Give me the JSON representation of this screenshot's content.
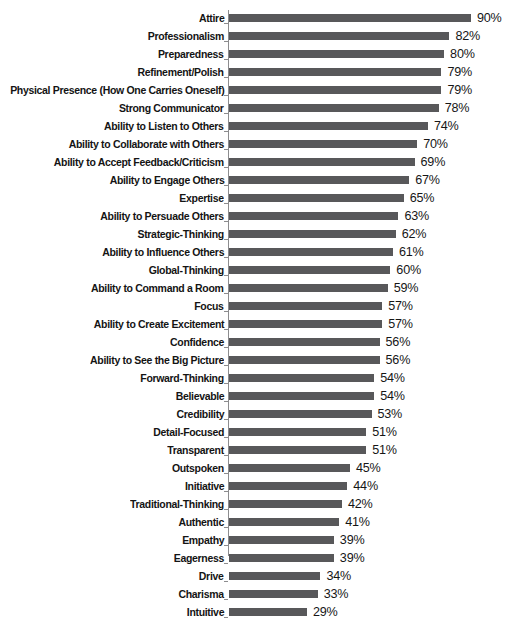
{
  "chart_data": {
    "type": "bar",
    "orientation": "horizontal",
    "title": "",
    "subtitle": "",
    "xlabel": "",
    "ylabel": "",
    "xlim": [
      0,
      90
    ],
    "grid": false,
    "legend": null,
    "value_suffix": "%",
    "bar_color": "#58585a",
    "axis_color": "#8c8c8e",
    "label_color": "#141414",
    "background": "#ffffff",
    "categories": [
      "Attire",
      "Professionalism",
      "Preparedness",
      "Refinement/Polish",
      "Physical Presence (How One Carries Oneself)",
      "Strong Communicator",
      "Ability to Listen to Others",
      "Ability to Collaborate with Others",
      "Ability to Accept Feedback/Criticism",
      "Ability to Engage Others",
      "Expertise",
      "Ability to Persuade Others",
      "Strategic-Thinking",
      "Ability to Influence Others",
      "Global-Thinking",
      "Ability to Command a Room",
      "Focus",
      "Ability to Create Excitement",
      "Confidence",
      "Ability to See the Big Picture",
      "Forward-Thinking",
      "Believable",
      "Credibility",
      "Detail-Focused",
      "Transparent",
      "Outspoken",
      "Initiative",
      "Traditional-Thinking",
      "Authentic",
      "Empathy",
      "Eagerness",
      "Drive",
      "Charisma",
      "Intuitive"
    ],
    "values": [
      90,
      82,
      80,
      79,
      79,
      78,
      74,
      70,
      69,
      67,
      65,
      63,
      62,
      61,
      60,
      59,
      57,
      57,
      56,
      56,
      54,
      54,
      53,
      51,
      51,
      45,
      44,
      42,
      41,
      39,
      39,
      34,
      33,
      29
    ],
    "value_labels": [
      "90%",
      "82%",
      "80%",
      "79%",
      "79%",
      "78%",
      "74%",
      "70%",
      "69%",
      "67%",
      "65%",
      "63%",
      "62%",
      "61%",
      "60%",
      "59%",
      "57%",
      "57%",
      "56%",
      "56%",
      "54%",
      "54%",
      "53%",
      "51%",
      "51%",
      "45%",
      "44%",
      "42%",
      "41%",
      "39%",
      "39%",
      "34%",
      "33%",
      "29%"
    ]
  }
}
